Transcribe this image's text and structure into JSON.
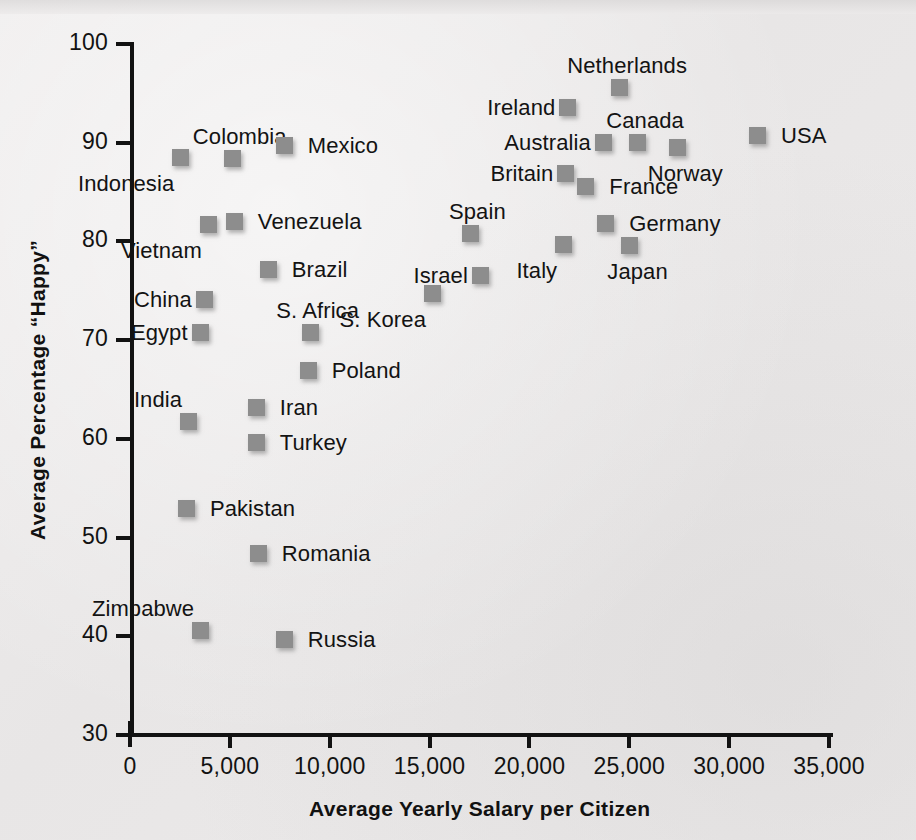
{
  "chart_data": {
    "type": "scatter",
    "title": "",
    "xlabel": "Average Yearly Salary per Citizen",
    "ylabel": "Average Percentage “Happy”",
    "xlim": [
      0,
      35000
    ],
    "ylim": [
      30,
      100
    ],
    "xticks": [
      0,
      5000,
      10000,
      15000,
      20000,
      25000,
      30000,
      35000
    ],
    "xtick_labels": [
      "0",
      "5,000",
      "10,000",
      "15,000",
      "20,000",
      "25,000",
      "30,000",
      "35,000"
    ],
    "yticks": [
      30,
      40,
      50,
      60,
      70,
      80,
      90,
      100
    ],
    "ytick_labels": [
      "30",
      "40",
      "50",
      "60",
      "70",
      "80",
      "90",
      "100"
    ],
    "grid": false,
    "legend": "none",
    "marker_color": "#8d8d8d",
    "marker_shape": "square",
    "points": [
      {
        "label": "Indonesia",
        "x": 2500,
        "y": 88.6,
        "label_pos": "below-left"
      },
      {
        "label": "Colombia",
        "x": 5100,
        "y": 88.5,
        "label_pos": "above"
      },
      {
        "label": "Mexico",
        "x": 7700,
        "y": 89.8,
        "label_pos": "right"
      },
      {
        "label": "Vietnam",
        "x": 3900,
        "y": 81.8,
        "label_pos": "below-left"
      },
      {
        "label": "Venezuela",
        "x": 5200,
        "y": 82.1,
        "label_pos": "right"
      },
      {
        "label": "Brazil",
        "x": 6900,
        "y": 77.2,
        "label_pos": "right"
      },
      {
        "label": "China",
        "x": 3700,
        "y": 74.2,
        "label_pos": "left"
      },
      {
        "label": "Egypt",
        "x": 3500,
        "y": 70.8,
        "label_pos": "left"
      },
      {
        "label": "S. Africa",
        "x": 9000,
        "y": 70.8,
        "label_pos": "above"
      },
      {
        "label": "Poland",
        "x": 8900,
        "y": 67.0,
        "label_pos": "right"
      },
      {
        "label": "India",
        "x": 2900,
        "y": 61.8,
        "label_pos": "above-left"
      },
      {
        "label": "Iran",
        "x": 6300,
        "y": 63.2,
        "label_pos": "right"
      },
      {
        "label": "Turkey",
        "x": 6300,
        "y": 59.7,
        "label_pos": "right"
      },
      {
        "label": "Pakistan",
        "x": 2800,
        "y": 53.0,
        "label_pos": "right"
      },
      {
        "label": "Romania",
        "x": 6400,
        "y": 48.4,
        "label_pos": "right"
      },
      {
        "label": "Zimbabwe",
        "x": 3500,
        "y": 40.6,
        "label_pos": "above-left"
      },
      {
        "label": "Russia",
        "x": 7700,
        "y": 39.7,
        "label_pos": "right"
      },
      {
        "label": "S. Korea",
        "x": 15100,
        "y": 74.8,
        "label_pos": "below-left"
      },
      {
        "label": "Israel",
        "x": 17500,
        "y": 76.6,
        "label_pos": "left"
      },
      {
        "label": "Spain",
        "x": 17000,
        "y": 80.9,
        "label_pos": "above"
      },
      {
        "label": "Italy",
        "x": 21700,
        "y": 79.7,
        "label_pos": "below-left"
      },
      {
        "label": "Germany",
        "x": 23800,
        "y": 81.9,
        "label_pos": "right"
      },
      {
        "label": "Japan",
        "x": 25000,
        "y": 79.6,
        "label_pos": "below"
      },
      {
        "label": "Britain",
        "x": 21800,
        "y": 86.9,
        "label_pos": "left"
      },
      {
        "label": "France",
        "x": 22800,
        "y": 85.6,
        "label_pos": "right"
      },
      {
        "label": "Australia",
        "x": 23700,
        "y": 90.1,
        "label_pos": "left"
      },
      {
        "label": "Canada",
        "x": 25400,
        "y": 90.1,
        "label_pos": "above"
      },
      {
        "label": "Ireland",
        "x": 21900,
        "y": 93.6,
        "label_pos": "left"
      },
      {
        "label": "Netherlands",
        "x": 24500,
        "y": 95.6,
        "label_pos": "above"
      },
      {
        "label": "Norway",
        "x": 27400,
        "y": 89.6,
        "label_pos": "below"
      },
      {
        "label": "USA",
        "x": 31400,
        "y": 90.8,
        "label_pos": "right"
      }
    ]
  },
  "axes": {
    "x_title": "Average Yearly Salary per Citizen",
    "y_title": "Average Percentage “Happy”"
  }
}
